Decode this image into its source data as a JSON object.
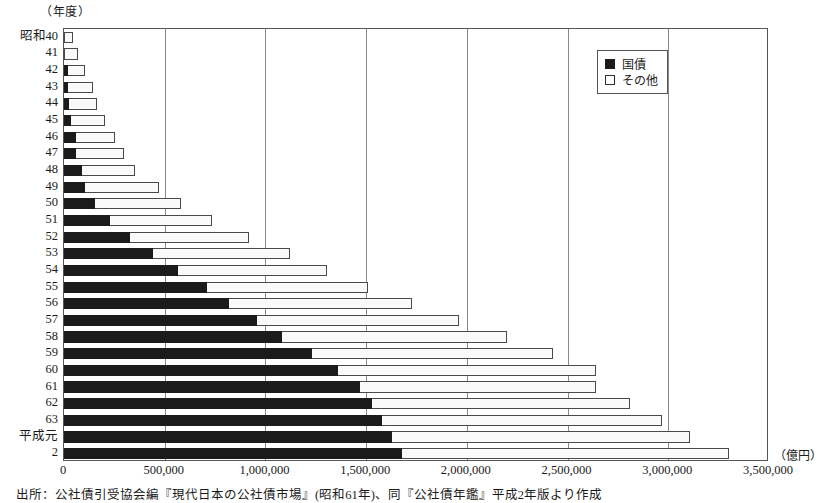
{
  "axis_unit_top": "（年度）",
  "axis_unit_right": "（億円）",
  "legend": {
    "items": [
      {
        "label": "国債",
        "swatch": "filled-square-icon",
        "color": "#1b1b1b"
      },
      {
        "label": "その他",
        "swatch": "open-square-icon",
        "color": "#ffffff"
      }
    ]
  },
  "caption": "出所：公社債引受協会編『現代日本の公社債市場』(昭和61年)、同『公社債年鑑』平成2年版より作成",
  "chart_data": {
    "type": "bar",
    "orientation": "horizontal",
    "stacked": true,
    "title": "",
    "xlabel": "（億円）",
    "ylabel": "（年度）",
    "xlim": [
      0,
      3500000
    ],
    "xticks": [
      0,
      500000,
      1000000,
      1500000,
      2000000,
      2500000,
      3000000,
      3500000
    ],
    "xtick_labels": [
      "0",
      "500,000",
      "1,000,000",
      "1,500,000",
      "2,000,000",
      "2,500,000",
      "3,000,000",
      "3,500,000"
    ],
    "grid": true,
    "grid_axis": "x",
    "legend_position": "top-right",
    "categories": [
      "昭和40",
      "41",
      "42",
      "43",
      "44",
      "45",
      "46",
      "47",
      "48",
      "49",
      "50",
      "51",
      "52",
      "53",
      "54",
      "55",
      "56",
      "57",
      "58",
      "59",
      "60",
      "61",
      "62",
      "63",
      "平成元",
      "2"
    ],
    "series": [
      {
        "name": "国債",
        "color": "#1b1b1b",
        "values": [
          0,
          0,
          19000,
          19500,
          24000,
          35000,
          61000,
          59000,
          87000,
          105000,
          155000,
          226000,
          330000,
          440000,
          565000,
          710000,
          820000,
          960000,
          1080000,
          1230000,
          1360000,
          1470000,
          1530000,
          1580000,
          1630000,
          1680000
        ]
      },
      {
        "name": "その他",
        "color": "#fafafa",
        "values": [
          46000,
          70000,
          86000,
          124000,
          141000,
          170000,
          194000,
          238000,
          267000,
          368000,
          427000,
          511000,
          590000,
          680000,
          740000,
          800000,
          910000,
          1000000,
          1120000,
          1200000,
          1280000,
          1170000,
          1280000,
          1390000,
          1480000,
          1620000
        ]
      }
    ],
    "totals": [
      46000,
      70000,
      105000,
      143500,
      165000,
      205000,
      255000,
      297000,
      354000,
      473000,
      582000,
      737000,
      920000,
      1120000,
      1305000,
      1510000,
      1730000,
      1960000,
      2200000,
      2430000,
      2640000,
      2640000,
      2810000,
      2970000,
      3110000,
      3300000
    ]
  }
}
